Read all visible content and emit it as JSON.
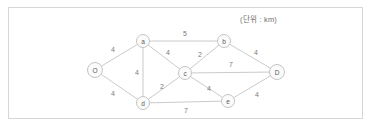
{
  "figure": {
    "unit_note": "(단위 : km)",
    "border_color": "#d6d6d6",
    "line_color": "#bdbdbd",
    "text_color": "#6e6e6e"
  },
  "chart_data": {
    "type": "diagram",
    "title": "",
    "subtitle": "(단위 : km)",
    "graph_kind": "weighted-undirected-network",
    "nodes": [
      {
        "id": "O",
        "label": "O",
        "x": 95,
        "y": 70,
        "r": 7.5
      },
      {
        "id": "a",
        "label": "a",
        "x": 143,
        "y": 41,
        "r": 6.5
      },
      {
        "id": "b",
        "label": "b",
        "x": 224,
        "y": 41,
        "r": 6.5
      },
      {
        "id": "c",
        "label": "c",
        "x": 185,
        "y": 73,
        "r": 6.5
      },
      {
        "id": "d",
        "label": "d",
        "x": 143,
        "y": 103,
        "r": 6.5
      },
      {
        "id": "e",
        "label": "e",
        "x": 228,
        "y": 101,
        "r": 6.5
      },
      {
        "id": "D",
        "label": "D",
        "x": 277,
        "y": 72,
        "r": 7.5
      }
    ],
    "edges": [
      {
        "from": "O",
        "to": "a",
        "weight": 4,
        "label_x": 113,
        "label_y": 49
      },
      {
        "from": "O",
        "to": "d",
        "weight": 4,
        "label_x": 113,
        "label_y": 93
      },
      {
        "from": "a",
        "to": "d",
        "weight": 4,
        "label_x": 137,
        "label_y": 72
      },
      {
        "from": "a",
        "to": "b",
        "weight": 5,
        "label_x": 185,
        "label_y": 33
      },
      {
        "from": "a",
        "to": "c",
        "weight": 4,
        "label_x": 168,
        "label_y": 52
      },
      {
        "from": "c",
        "to": "b",
        "weight": 2,
        "label_x": 200,
        "label_y": 54
      },
      {
        "from": "c",
        "to": "d",
        "weight": 2,
        "label_x": 162,
        "label_y": 86
      },
      {
        "from": "c",
        "to": "e",
        "weight": 4,
        "label_x": 209,
        "label_y": 88
      },
      {
        "from": "c",
        "to": "D",
        "weight": 7,
        "label_x": 231,
        "label_y": 64
      },
      {
        "from": "b",
        "to": "D",
        "weight": 4,
        "label_x": 256,
        "label_y": 52
      },
      {
        "from": "e",
        "to": "D",
        "weight": 4,
        "label_x": 257,
        "label_y": 94
      },
      {
        "from": "d",
        "to": "e",
        "weight": 7,
        "label_x": 186,
        "label_y": 110
      }
    ]
  }
}
